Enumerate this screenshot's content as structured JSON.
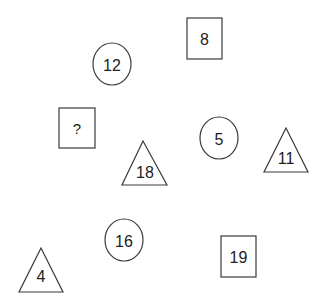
{
  "diagram": {
    "type": "shape-number-puzzle",
    "colors": {
      "stroke": "#3a3a3a",
      "text": "#222222",
      "background": "#ffffff"
    },
    "shapes": [
      {
        "id": "circle-12",
        "shape": "circle",
        "label": "12",
        "cx": 112,
        "cy": 64,
        "rx": 19,
        "ry": 21
      },
      {
        "id": "square-8",
        "shape": "square",
        "label": "8",
        "x": 187,
        "y": 18,
        "w": 35,
        "h": 41
      },
      {
        "id": "square-unknown",
        "shape": "square",
        "label": "?",
        "x": 59,
        "y": 108,
        "w": 36,
        "h": 40
      },
      {
        "id": "triangle-18",
        "shape": "triangle",
        "label": "18",
        "apex": [
          143,
          141
        ],
        "left": [
          122,
          185
        ],
        "right": [
          167,
          185
        ]
      },
      {
        "id": "circle-5",
        "shape": "circle",
        "label": "5",
        "cx": 219,
        "cy": 138,
        "rx": 19,
        "ry": 21
      },
      {
        "id": "triangle-11",
        "shape": "triangle",
        "label": "11",
        "apex": [
          286,
          128
        ],
        "left": [
          264,
          172
        ],
        "right": [
          308,
          172
        ]
      },
      {
        "id": "circle-16",
        "shape": "circle",
        "label": "16",
        "cx": 124,
        "cy": 240,
        "rx": 19,
        "ry": 21
      },
      {
        "id": "triangle-4",
        "shape": "triangle",
        "label": "4",
        "apex": [
          41,
          248
        ],
        "left": [
          19,
          292
        ],
        "right": [
          63,
          292
        ]
      },
      {
        "id": "square-19",
        "shape": "square",
        "label": "19",
        "x": 221,
        "y": 236,
        "w": 35,
        "h": 41
      }
    ]
  }
}
